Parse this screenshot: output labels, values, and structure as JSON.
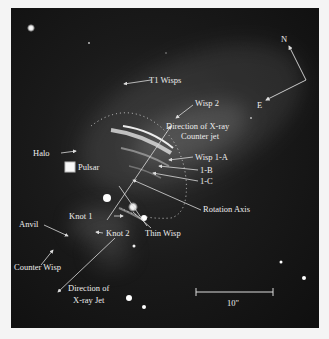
{
  "figure": {
    "background": "#f4f4f4",
    "image_background": "#141414",
    "label_color": "#ededed",
    "labels": {
      "t1_wisps": "T1 Wisps",
      "wisp2": "Wisp 2",
      "counter_jet_line1": "Direction of X-ray",
      "counter_jet_line2": "Counter jet",
      "halo": "Halo",
      "wisp1a": "Wisp 1-A",
      "wisp1b": "1-B",
      "wisp1c": "1-C",
      "pulsar": "Pulsar",
      "knot1": "Knot 1",
      "rotation_axis": "Rotation Axis",
      "thin_wisp": "Thin Wisp",
      "anvil": "Anvil",
      "knot2": "Knot 2",
      "counter_wisp": "Counter Wisp",
      "jet_line1": "Direction of",
      "jet_line2": "X-ray Jet"
    },
    "compass": {
      "north": "N",
      "east": "E"
    },
    "scale_bar": {
      "label": "10\""
    }
  }
}
